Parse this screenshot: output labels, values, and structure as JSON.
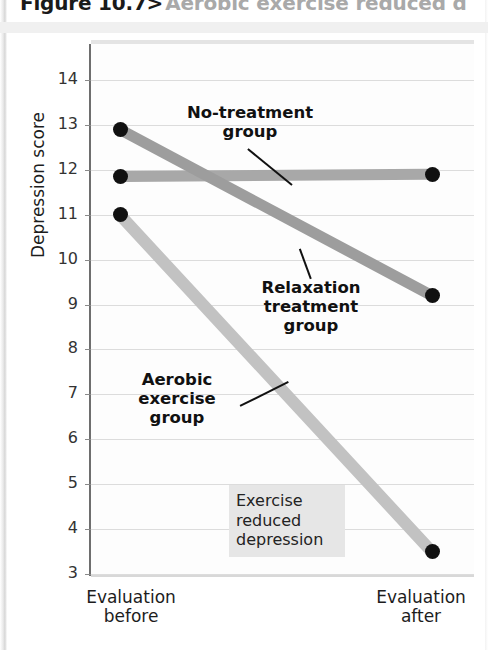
{
  "figure": {
    "number": "Figure 10.7>",
    "caption": "Aerobic exercise reduced d",
    "number_color": "#1a1a1a",
    "caption_color": "#a9a9a9"
  },
  "chart_data": {
    "type": "line",
    "xlabel": "",
    "ylabel": "Depression score",
    "x": [
      "Evaluation before",
      "Evaluation after"
    ],
    "x_tick_labels": [
      "Evaluation\nbefore",
      "Evaluation\nafter"
    ],
    "y_tick_labels": [
      "14",
      "13",
      "12",
      "11",
      "10",
      "9",
      "8",
      "7",
      "6",
      "5",
      "4",
      "3"
    ],
    "y_ticks": [
      14,
      13,
      12,
      11,
      10,
      9,
      8,
      7,
      6,
      5,
      4,
      3
    ],
    "ylim": [
      3,
      14.8
    ],
    "grid": "horizontal",
    "legend": "inline-annotations",
    "series": [
      {
        "name": "No-treatment group",
        "values": [
          11.85,
          11.9
        ],
        "color": "#a8a8a8",
        "label_text": "No-treatment\ngroup"
      },
      {
        "name": "Relaxation treatment group",
        "values": [
          12.9,
          9.2
        ],
        "color": "#9d9d9d",
        "label_text": "Relaxation\ntreatment\ngroup"
      },
      {
        "name": "Aerobic exercise group",
        "values": [
          11.0,
          3.5
        ],
        "color": "#c2c2c2",
        "label_text": "Aerobic\nexercise\ngroup"
      }
    ],
    "annotations": [
      {
        "name": "exercise-reduced-depression",
        "text": "Exercise\nreduced\ndepression",
        "background": "#e6e6e6"
      }
    ]
  },
  "axes": {
    "y_title": "Depression score",
    "x_left_label": "Evaluation\nbefore",
    "x_right_label": "Evaluation\nafter"
  },
  "ticks": {
    "y": [
      "14",
      "13",
      "12",
      "11",
      "10",
      "9",
      "8",
      "7",
      "6",
      "5",
      "4",
      "3"
    ]
  },
  "annotations": {
    "no_treatment": "No-treatment\ngroup",
    "relaxation": "Relaxation\ntreatment\ngroup",
    "aerobic": "Aerobic\nexercise\ngroup",
    "callout": "Exercise\nreduced\ndepression"
  }
}
